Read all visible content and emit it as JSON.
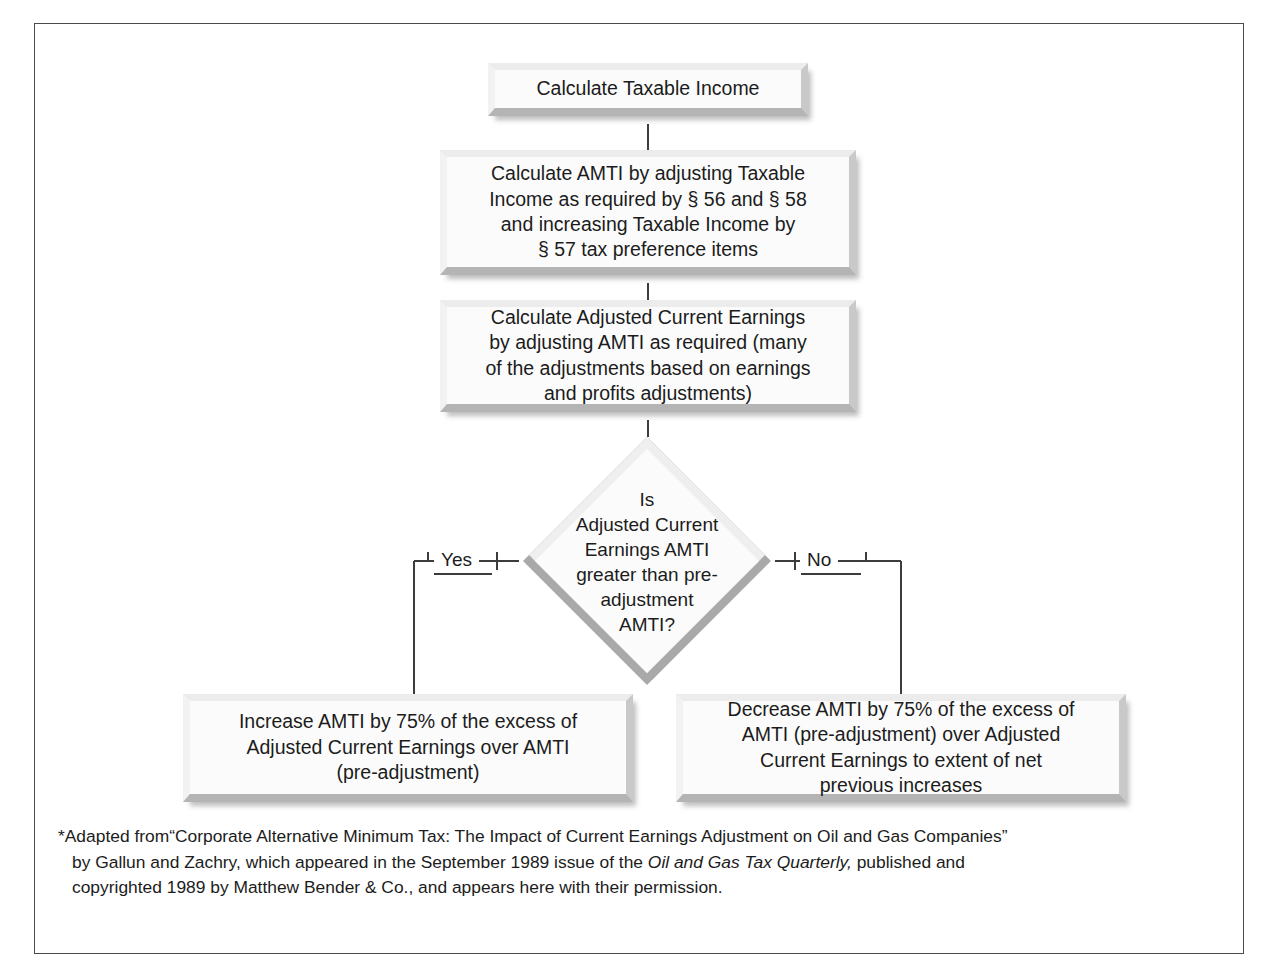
{
  "diagram": {
    "type": "flowchart",
    "nodes": [
      {
        "id": "taxable-income",
        "shape": "process",
        "text": "Calculate Taxable Income"
      },
      {
        "id": "amti",
        "shape": "process",
        "text": "Calculate AMTI by adjusting Taxable\nIncome as required by § 56 and § 58\nand increasing Taxable Income by\n§ 57 tax preference items"
      },
      {
        "id": "ace",
        "shape": "process",
        "text": "Calculate Adjusted Current Earnings\nby adjusting AMTI as required (many\nof the adjustments based on earnings\nand profits adjustments)"
      },
      {
        "id": "decision",
        "shape": "decision",
        "text": "Is\nAdjusted Current\nEarnings AMTI\ngreater than pre-\nadjustment\nAMTI?"
      },
      {
        "id": "increase",
        "shape": "process",
        "text": "Increase AMTI by 75% of the excess of\nAdjusted Current Earnings over AMTI\n(pre-adjustment)"
      },
      {
        "id": "decrease",
        "shape": "process",
        "text": "Decrease AMTI by 75% of the excess of\nAMTI (pre-adjustment) over Adjusted\nCurrent Earnings to extent of net\nprevious increases"
      }
    ],
    "edges": [
      {
        "from": "taxable-income",
        "to": "amti",
        "label": ""
      },
      {
        "from": "amti",
        "to": "ace",
        "label": ""
      },
      {
        "from": "ace",
        "to": "decision",
        "label": ""
      },
      {
        "from": "decision",
        "to": "increase",
        "label": "Yes"
      },
      {
        "from": "decision",
        "to": "decrease",
        "label": "No"
      }
    ],
    "branch_labels": {
      "yes": "Yes",
      "no": "No"
    },
    "colors": {
      "node_fill": "#fbfbfb",
      "bevel_light": "#ececec",
      "bevel_shadow": "#b4b4b4",
      "line": "#3c3c3c",
      "frame": "#4a4a50",
      "text": "#1c1c1c"
    }
  },
  "footnote": {
    "line1_a": "*Adapted from",
    "line1_quote": "“Corporate Alternative Minimum Tax: The Impact of Current Earnings Adjustment on Oil and Gas Companies”",
    "line1": "*Adapted from“Corporate Alternative Minimum Tax: The Impact of Current Earnings Adjustment on Oil and Gas Companies”",
    "line2_pre": "by Gallun and Zachry, which appeared in the September 1989 issue of the ",
    "line2_italic": "Oil and Gas Tax Quarterly,",
    "line2_post": " published and",
    "line3": "copyrighted 1989 by Matthew Bender & Co., and appears here with their permission."
  }
}
